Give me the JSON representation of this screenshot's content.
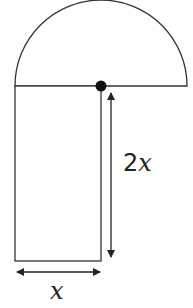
{
  "diagram": {
    "colors": {
      "stroke": "#333333",
      "fill": "#ffffff",
      "dot": "#111111"
    },
    "shapes": {
      "semicircle": {
        "label": "semicircle"
      },
      "rectangle": {
        "label": "rectangle"
      }
    },
    "labels": {
      "height": "2x",
      "height_coef": "2",
      "height_var": "x",
      "width": "x"
    }
  }
}
